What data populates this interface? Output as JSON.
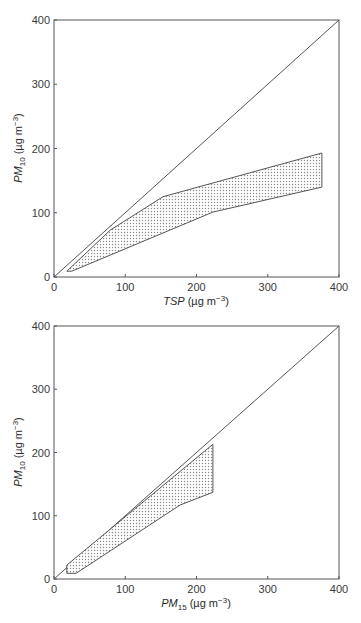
{
  "chart_data": [
    {
      "type": "area",
      "title": "",
      "xlabel": "TSP (µg m⁻³)",
      "xlabel_parts": {
        "var": "TSP",
        "units": " (µg m",
        "exp": "−3",
        "close": ")"
      },
      "ylabel": "PM10 (µg m⁻³)",
      "ylabel_parts": {
        "var": "PM",
        "sub": "10",
        "units": " (µg m",
        "exp": "−3",
        "close": ")"
      },
      "xlim": [
        0,
        400
      ],
      "ylim": [
        0,
        400
      ],
      "xticks": [
        0,
        100,
        200,
        300,
        400
      ],
      "yticks": [
        0,
        100,
        200,
        300,
        400
      ],
      "grid": false,
      "reference_line": {
        "name": "1:1 line",
        "points": [
          [
            0,
            0
          ],
          [
            400,
            400
          ]
        ]
      },
      "shaded_band": {
        "fill": "stippled",
        "upper": [
          [
            18,
            9
          ],
          [
            79,
            73
          ],
          [
            153,
            125
          ],
          [
            376,
            193
          ]
        ],
        "lower": [
          [
            25,
            9
          ],
          [
            223,
            101
          ],
          [
            376,
            140
          ]
        ]
      }
    },
    {
      "type": "area",
      "title": "",
      "xlabel": "PM15 (µg m⁻³)",
      "xlabel_parts": {
        "var": "PM",
        "sub": "15",
        "units": " (µg m",
        "exp": "−3",
        "close": ")"
      },
      "ylabel": "PM10 (µg m⁻³)",
      "ylabel_parts": {
        "var": "PM",
        "sub": "10",
        "units": " (µg m",
        "exp": "−3",
        "close": ")"
      },
      "xlim": [
        0,
        400
      ],
      "ylim": [
        0,
        400
      ],
      "xticks": [
        0,
        100,
        200,
        300,
        400
      ],
      "yticks": [
        0,
        100,
        200,
        300,
        400
      ],
      "grid": false,
      "reference_line": {
        "name": "1:1 line",
        "points": [
          [
            0,
            0
          ],
          [
            400,
            400
          ]
        ]
      },
      "shaded_band": {
        "fill": "stippled",
        "upper": [
          [
            18,
            22
          ],
          [
            223,
            213
          ]
        ],
        "lower": [
          [
            18,
            9
          ],
          [
            31,
            9
          ],
          [
            177,
            117
          ],
          [
            223,
            137
          ]
        ]
      }
    }
  ],
  "colors": {
    "axis": "#555555",
    "line": "#555555",
    "stipple": "#888888"
  }
}
